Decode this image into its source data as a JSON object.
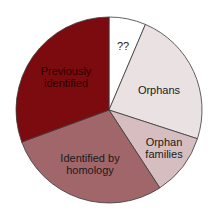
{
  "chart_data": {
    "type": "pie",
    "title": "",
    "start_angle_deg": 0,
    "direction": "clockwise",
    "slices": [
      {
        "label": "??",
        "value": 6.4,
        "color": "#ffffff"
      },
      {
        "label": "Orphans",
        "value": 23.6,
        "color": "#e9e1e2"
      },
      {
        "label": "Orphan families",
        "value": 10.8,
        "color": "#d6bec0"
      },
      {
        "label": "Identified by homology",
        "value": 28.6,
        "color": "#a1666a"
      },
      {
        "label": "Previously identified",
        "value": 30.6,
        "color": "#7c0b10"
      }
    ],
    "legend": "none (labels inside slices)"
  },
  "labels": {
    "unknown": "??",
    "orphans": "Orphans",
    "orphan_families_l1": "Orphan",
    "orphan_families_l2": "families",
    "homology_l1": "Identified by",
    "homology_l2": "homology",
    "previous_l1": "Previously",
    "previous_l2": "identified"
  }
}
